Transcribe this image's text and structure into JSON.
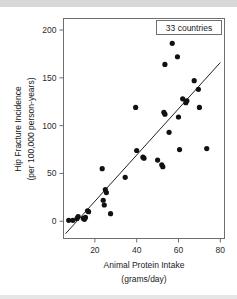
{
  "chart_data": {
    "type": "scatter",
    "title": "",
    "xlabel": "Animal Protein Intake",
    "xlabel_units": "(grams/day)",
    "ylabel": "Hip Fracture Incidence",
    "ylabel_units": "(per 100,000 person-years)",
    "xlim": [
      5,
      82
    ],
    "ylim": [
      -18,
      212
    ],
    "xticks": [
      20,
      40,
      60,
      80
    ],
    "yticks": [
      0,
      50,
      100,
      150,
      200
    ],
    "grid": false,
    "legend_position": "top-right",
    "annotation": "33 countries",
    "point_count": 33,
    "marker": "filled-circle",
    "marker_color": "#111111",
    "axis_color": "#6e6e6e",
    "background_color": "#ffffff",
    "points": [
      {
        "x": 7.5,
        "y": 1
      },
      {
        "x": 9.5,
        "y": 1
      },
      {
        "x": 11.5,
        "y": 3
      },
      {
        "x": 12.0,
        "y": 5
      },
      {
        "x": 14.5,
        "y": 3
      },
      {
        "x": 15.0,
        "y": 2
      },
      {
        "x": 15.5,
        "y": 4
      },
      {
        "x": 16.5,
        "y": 11
      },
      {
        "x": 17.0,
        "y": 10
      },
      {
        "x": 23.5,
        "y": 55
      },
      {
        "x": 24.0,
        "y": 22
      },
      {
        "x": 24.5,
        "y": 17
      },
      {
        "x": 25.0,
        "y": 33
      },
      {
        "x": 25.5,
        "y": 30
      },
      {
        "x": 27.5,
        "y": 8
      },
      {
        "x": 34.5,
        "y": 46
      },
      {
        "x": 39.5,
        "y": 119
      },
      {
        "x": 40.0,
        "y": 74
      },
      {
        "x": 43.0,
        "y": 67
      },
      {
        "x": 43.5,
        "y": 66
      },
      {
        "x": 50.0,
        "y": 64
      },
      {
        "x": 52.0,
        "y": 59
      },
      {
        "x": 52.5,
        "y": 57
      },
      {
        "x": 53.0,
        "y": 114
      },
      {
        "x": 53.5,
        "y": 112
      },
      {
        "x": 53.5,
        "y": 164
      },
      {
        "x": 55.5,
        "y": 93
      },
      {
        "x": 57.0,
        "y": 186
      },
      {
        "x": 59.5,
        "y": 172
      },
      {
        "x": 60.0,
        "y": 109
      },
      {
        "x": 60.5,
        "y": 75
      },
      {
        "x": 61.5,
        "y": 199
      },
      {
        "x": 62.0,
        "y": 128
      },
      {
        "x": 63.5,
        "y": 124
      },
      {
        "x": 64.0,
        "y": 126
      },
      {
        "x": 67.5,
        "y": 147
      },
      {
        "x": 69.5,
        "y": 138
      },
      {
        "x": 70.0,
        "y": 119
      },
      {
        "x": 73.5,
        "y": 76
      }
    ],
    "fit_line": {
      "x_start": 6.0,
      "y_start": -13.0,
      "x_end": 80.0,
      "y_end": 166.0
    }
  },
  "axis": {
    "x_tick_labels": [
      "20",
      "40",
      "60",
      "80"
    ],
    "y_tick_labels": [
      "0",
      "50",
      "100",
      "150",
      "200"
    ]
  }
}
